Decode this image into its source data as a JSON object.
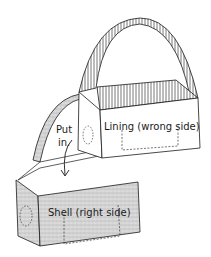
{
  "diagram": {
    "labels": {
      "put_in_line1": "Put",
      "put_in_line2": "in.",
      "lining": "Lining (wrong side)",
      "shell": "Shell (right side)"
    },
    "colors": {
      "stroke": "#1a1a1a",
      "shell_fill": "#d4d4d4",
      "lining_fill": "#ffffff",
      "stripe": "#555555"
    }
  }
}
